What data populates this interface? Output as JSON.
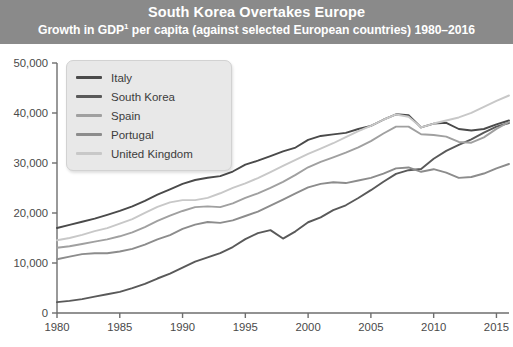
{
  "header": {
    "title": "South Korea Overtakes Europe",
    "subtitle_pre": "Growth in GDP",
    "subtitle_sup": "1",
    "subtitle_post": " per capita (against selected European countries) 1980–2016",
    "band_color": "#8a8a8a"
  },
  "legend": {
    "position": "top-left-inside",
    "items": [
      {
        "label": "Italy",
        "color": "#4a4a4a"
      },
      {
        "label": "South Korea",
        "color": "#595959"
      },
      {
        "label": "Spain",
        "color": "#a0a0a0"
      },
      {
        "label": "Portugal",
        "color": "#8c8c8c"
      },
      {
        "label": "United Kingdom",
        "color": "#c8c8c8"
      }
    ]
  },
  "chart_data": {
    "type": "line",
    "title": "South Korea Overtakes Europe",
    "subtitle": "Growth in GDP¹ per capita (against selected European countries) 1980–2016",
    "xlabel": "",
    "ylabel": "",
    "grid": false,
    "legend_position": "top-left",
    "xlim": [
      1980,
      2016
    ],
    "ylim": [
      0,
      50000
    ],
    "xticks": [
      1980,
      1985,
      1990,
      1995,
      2000,
      2005,
      2010,
      2015
    ],
    "xticklabels": [
      "1980",
      "1985",
      "1990",
      "1995",
      "2000",
      "2005",
      "2010",
      "2015"
    ],
    "yticks": [
      0,
      10000,
      20000,
      30000,
      40000,
      50000
    ],
    "yticklabels": [
      "0",
      "10,000",
      "20,000",
      "30,000",
      "40,000",
      "50,000"
    ],
    "x": [
      1980,
      1981,
      1982,
      1983,
      1984,
      1985,
      1986,
      1987,
      1988,
      1989,
      1990,
      1991,
      1992,
      1993,
      1994,
      1995,
      1996,
      1997,
      1998,
      1999,
      2000,
      2001,
      2002,
      2003,
      2004,
      2005,
      2006,
      2007,
      2008,
      2009,
      2010,
      2011,
      2012,
      2013,
      2014,
      2015,
      2016
    ],
    "series": [
      {
        "name": "Italy",
        "color": "#4a4a4a",
        "values": [
          11000,
          11400,
          11800,
          12200,
          12700,
          13200,
          13800,
          14500,
          15300,
          16000,
          16700,
          17200,
          17500,
          17700,
          18300,
          19200,
          19700,
          20300,
          20900,
          21400,
          22400,
          22900,
          23100,
          23300,
          23800,
          24200,
          25000,
          25700,
          25600,
          24000,
          24500,
          24600,
          23800,
          23600,
          23800,
          24400,
          24900
        ]
      },
      {
        "name": "South Korea",
        "color": "#595959",
        "values": [
          1800,
          2000,
          2300,
          2700,
          3100,
          3500,
          4100,
          4800,
          5700,
          6500,
          7500,
          8500,
          9200,
          9900,
          10900,
          12200,
          13200,
          13700,
          12300,
          13500,
          15000,
          15800,
          17000,
          17800,
          19000,
          20300,
          21700,
          23000,
          23600,
          23800,
          25500,
          26800,
          27800,
          28700,
          29800,
          30800,
          31400
        ]
      },
      {
        "name": "Spain",
        "color": "#a0a0a0",
        "values": [
          8500,
          8700,
          9000,
          9300,
          9600,
          10000,
          10500,
          11200,
          12000,
          12700,
          13300,
          13800,
          13900,
          13800,
          14300,
          15000,
          15600,
          16300,
          17100,
          18000,
          19000,
          19700,
          20300,
          20900,
          21600,
          22400,
          23400,
          24300,
          24300,
          23300,
          23200,
          23000,
          22300,
          22200,
          22900,
          24000,
          24900
        ]
      },
      {
        "name": "Portugal",
        "color": "#8c8c8c",
        "values": [
          6200,
          6500,
          6800,
          6900,
          6900,
          7100,
          7400,
          7900,
          8500,
          9000,
          9700,
          10200,
          10500,
          10400,
          10700,
          11200,
          11700,
          12400,
          13100,
          13800,
          14500,
          14900,
          15100,
          15000,
          15300,
          15600,
          16100,
          16700,
          16800,
          16300,
          16600,
          16200,
          15600,
          15700,
          16100,
          16700,
          17200
        ]
      },
      {
        "name": "United Kingdom",
        "color": "#c8c8c8",
        "values": [
          9600,
          9900,
          10300,
          10800,
          11200,
          11800,
          12400,
          13200,
          14000,
          14600,
          14900,
          14900,
          15200,
          15800,
          16500,
          17100,
          17800,
          18600,
          19400,
          20200,
          21000,
          21700,
          22400,
          23200,
          24000,
          24700,
          25500,
          26200,
          25900,
          24500,
          25000,
          25400,
          25800,
          26400,
          27200,
          28000,
          28700
        ]
      }
    ],
    "note": "Values shown are approximate readings in constant US dollars per capita; series lines are indexed so 2016 endpoints are Italy ≈38,500, South Korea ≈38,000, Spain ≈38,200, Portugal ≈29,800, United Kingdom ≈43,500."
  },
  "axes": {
    "y_labels": [
      "50,000",
      "40,000",
      "30,000",
      "20,000",
      "10,000",
      "0"
    ],
    "x_labels": [
      "1980",
      "1985",
      "1990",
      "1995",
      "2000",
      "2005",
      "2010",
      "2015"
    ]
  }
}
